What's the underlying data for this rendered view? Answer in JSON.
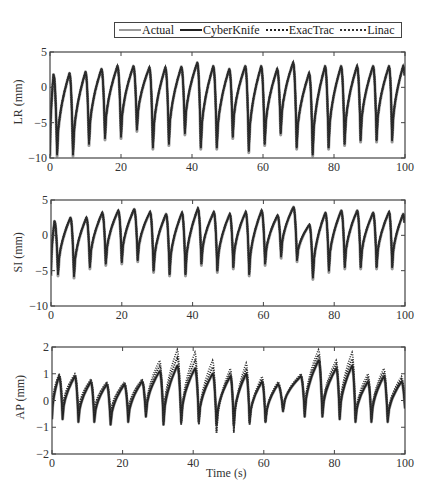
{
  "legend": {
    "items": [
      {
        "label": "Actual",
        "style": "solid",
        "color": "#9a9a9a"
      },
      {
        "label": "CyberKnife",
        "style": "solid",
        "color": "#222222"
      },
      {
        "label": "ExacTrac",
        "style": "dotted",
        "color": "#222222"
      },
      {
        "label": "Linac",
        "style": "dotted",
        "color": "#333333"
      }
    ]
  },
  "xlabel": "Time (s)",
  "chart_data": [
    {
      "type": "line",
      "title": "",
      "xlabel": "",
      "ylabel": "LR (mm)",
      "xlim": [
        0,
        100
      ],
      "ylim": [
        -10,
        5
      ],
      "xticks": [
        0,
        20,
        40,
        60,
        80,
        100
      ],
      "yticks": [
        5,
        0,
        -5,
        -10
      ],
      "legend": [
        "Actual",
        "CyberKnife",
        "ExacTrac",
        "Linac"
      ],
      "cycle_peaks_s": [
        1,
        5.5,
        10,
        14.5,
        19,
        23.5,
        28,
        32.5,
        37,
        41.5,
        46,
        50.5,
        55,
        59.5,
        64,
        68.5,
        73,
        77.5,
        82,
        86.5,
        91,
        95.5,
        99.5
      ],
      "peak_values": [
        1.8,
        2.0,
        2.2,
        2.6,
        3.0,
        3.0,
        2.8,
        2.8,
        2.9,
        3.5,
        3.0,
        2.6,
        3.0,
        3.0,
        2.6,
        3.5,
        2.0,
        3.0,
        3.0,
        3.0,
        3.0,
        3.0,
        3.0
      ],
      "trough_values": [
        -9.5,
        -9.5,
        -8.0,
        -7.2,
        -7.0,
        -6.0,
        -8.5,
        -8.0,
        -6.5,
        -8.5,
        -8.5,
        -7.0,
        -9.0,
        -8.0,
        -6.5,
        -8.5,
        -9.5,
        -8.5,
        -8.0,
        -7.5,
        -7.5,
        -7.5,
        -5.0
      ],
      "notes": "Respiratory-like sawtooth; all four series overlap closely, Actual (grey) visible at trough edges."
    },
    {
      "type": "line",
      "title": "",
      "xlabel": "",
      "ylabel": "SI (mm)",
      "xlim": [
        0,
        100
      ],
      "ylim": [
        -10,
        5
      ],
      "xticks": [
        0,
        20,
        40,
        60,
        80,
        100
      ],
      "yticks": [
        5,
        0,
        -5,
        -10
      ],
      "legend": [
        "Actual",
        "CyberKnife",
        "ExacTrac",
        "Linac"
      ],
      "cycle_peaks_s": [
        1,
        5.5,
        10,
        14.5,
        19,
        23.5,
        28,
        32.5,
        37,
        41.5,
        46,
        50.5,
        55,
        59.5,
        64,
        68.5,
        73,
        77.5,
        82,
        86.5,
        91,
        95.5,
        99.5
      ],
      "peak_values": [
        2.0,
        2.5,
        2.5,
        3.2,
        3.5,
        3.7,
        3.3,
        3.0,
        3.2,
        3.8,
        3.3,
        3.0,
        3.3,
        3.5,
        2.8,
        4.0,
        1.5,
        3.2,
        3.5,
        3.5,
        3.2,
        3.3,
        3.0
      ],
      "trough_values": [
        -5.5,
        -5.8,
        -4.5,
        -4.0,
        -3.8,
        -3.5,
        -5.0,
        -5.5,
        -5.5,
        -4.0,
        -5.0,
        -4.5,
        -5.5,
        -4.0,
        -3.0,
        -3.5,
        -6.0,
        -5.0,
        -4.5,
        -4.5,
        -4.5,
        -4.5,
        -4.5
      ],
      "notes": "Series nearly indistinguishable; grey Actual peeks out at peaks."
    },
    {
      "type": "line",
      "title": "",
      "xlabel": "Time (s)",
      "ylabel": "AP (mm)",
      "xlim": [
        0,
        100
      ],
      "ylim": [
        -2,
        2
      ],
      "xticks": [
        0,
        20,
        40,
        60,
        80,
        100
      ],
      "yticks": [
        2,
        1,
        0,
        -1,
        -2
      ],
      "legend": [
        "Actual",
        "CyberKnife",
        "ExacTrac",
        "Linac"
      ],
      "cycle_peaks_s": [
        2,
        6.5,
        11,
        15.5,
        20.5,
        25.5,
        30.5,
        35.5,
        40.5,
        45.5,
        50.5,
        55,
        59.5,
        64,
        70.5,
        75.5,
        80.5,
        85,
        89.5,
        94,
        99
      ],
      "peak_values_actual": [
        0.9,
        0.9,
        0.7,
        0.6,
        0.6,
        0.7,
        1.1,
        1.3,
        1.2,
        1.0,
        0.9,
        1.0,
        0.7,
        0.6,
        0.9,
        1.5,
        1.2,
        1.3,
        0.7,
        0.9,
        0.7
      ],
      "peak_values_linac": [
        1.0,
        1.0,
        0.8,
        0.7,
        0.7,
        0.8,
        1.5,
        1.9,
        1.8,
        1.5,
        1.2,
        1.4,
        0.9,
        0.7,
        1.0,
        1.9,
        1.5,
        1.8,
        1.0,
        1.2,
        0.9
      ],
      "trough_values_actual": [
        -0.7,
        -0.8,
        -0.8,
        -0.9,
        -0.8,
        -0.6,
        -0.9,
        -0.8,
        -0.8,
        -0.9,
        -0.9,
        -0.8,
        -0.8,
        -0.4,
        -0.6,
        -0.6,
        -0.7,
        -0.8,
        -0.8,
        -0.8,
        -0.3
      ],
      "trough_values_linac": [
        -0.4,
        -0.5,
        -0.5,
        -0.6,
        -0.5,
        -0.5,
        -0.8,
        -0.9,
        -0.9,
        -1.2,
        -1.2,
        -0.9,
        -0.8,
        -0.4,
        -0.5,
        -0.5,
        -0.6,
        -0.7,
        -0.7,
        -0.7,
        -0.2
      ],
      "notes": "Sharp peaks; dotted Linac/ExacTrac overshoot peaks (up to ~1.9 mm) between 30-50 s and 75-85 s; grey Actual sits lower at troughs."
    }
  ]
}
